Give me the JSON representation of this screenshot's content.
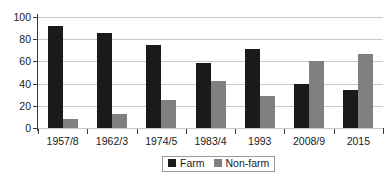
{
  "chart_data": {
    "type": "bar",
    "title": "",
    "xlabel": "",
    "ylabel": "",
    "ylim": [
      0,
      100
    ],
    "yticks": [
      0,
      20,
      40,
      60,
      80,
      100
    ],
    "grid": true,
    "legend_position": "bottom-center",
    "categories": [
      "1957/8",
      "1962/3",
      "1974/5",
      "1983/4",
      "1993",
      "2008/9",
      "2015"
    ],
    "series": [
      {
        "name": "Farm",
        "color": "#1a1a1a",
        "values": [
          92,
          86,
          75,
          59,
          71,
          40,
          34
        ]
      },
      {
        "name": "Non-farm",
        "color": "#808080",
        "values": [
          8,
          13,
          25,
          42,
          29,
          60,
          67
        ]
      }
    ]
  },
  "legend": {
    "items": [
      {
        "label": "Farm",
        "swatch": "legend-swatch-black"
      },
      {
        "label": "Non-farm",
        "swatch": "legend-swatch-gray"
      }
    ]
  },
  "colors": {
    "farm": "#1a1a1a",
    "nonfarm": "#808080",
    "gridline": "#c9c9c9",
    "axis": "#3b3b3b",
    "background": "#ffffff"
  }
}
